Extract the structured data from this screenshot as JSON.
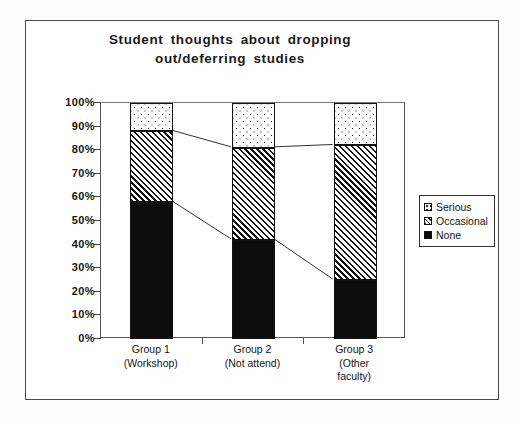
{
  "chart_data": {
    "type": "bar",
    "stacked": true,
    "title": "Student thoughts about dropping out/deferring studies",
    "title_lines": [
      "Student thoughts about dropping",
      "out/deferring  studies"
    ],
    "xlabel": "",
    "ylabel": "",
    "ylim": [
      0,
      100
    ],
    "ytick_labels": [
      "100%",
      "90%",
      "80%",
      "70%",
      "60%",
      "50%",
      "40%",
      "30%",
      "20%",
      "10%",
      "0%"
    ],
    "ytick_values": [
      100,
      90,
      80,
      70,
      60,
      50,
      40,
      30,
      20,
      10,
      0
    ],
    "grid": false,
    "legend_position": "right",
    "categories": [
      "Group 1 (Workshop)",
      "Group 2 (Not attend)",
      "Group 3 (Other faculty)"
    ],
    "category_lines": [
      [
        "Group 1",
        "(Workshop)"
      ],
      [
        "Group 2",
        "(Not attend)"
      ],
      [
        "Group 3",
        "(Other",
        "faculty)"
      ]
    ],
    "series": [
      {
        "name": "None",
        "values": [
          58,
          42,
          25
        ],
        "pattern": "solid-black",
        "color": "#0d0d0d"
      },
      {
        "name": "Occasional",
        "values": [
          30,
          39,
          57
        ],
        "pattern": "diagonal-hatch",
        "color": "#ffffff"
      },
      {
        "name": "Serious",
        "values": [
          12,
          19,
          18
        ],
        "pattern": "dotted",
        "color": "#ffffff"
      }
    ],
    "cumulative_tops": {
      "none": [
        58,
        42,
        25
      ],
      "occasional": [
        88,
        81,
        82
      ],
      "serious": [
        100,
        100,
        100
      ]
    }
  },
  "legend": {
    "items": [
      {
        "label": "Serious",
        "swatch": "dotted-swatch"
      },
      {
        "label": "Occasional",
        "swatch": "hatch-swatch"
      },
      {
        "label": "None",
        "swatch": "solid-swatch"
      }
    ]
  }
}
